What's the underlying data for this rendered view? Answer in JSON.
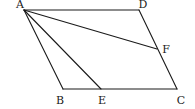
{
  "figure": {
    "type": "parallelogram-geometry",
    "points": {
      "A": {
        "label": "A",
        "x": 24,
        "y": 10,
        "lx": 20,
        "ly": 8
      },
      "D": {
        "label": "D",
        "x": 139,
        "y": 10,
        "lx": 143,
        "ly": 8
      },
      "F": {
        "label": "F",
        "x": 157,
        "y": 49,
        "lx": 166,
        "ly": 53
      },
      "C": {
        "label": "C",
        "x": 177,
        "y": 89,
        "lx": 181,
        "ly": 104
      },
      "B": {
        "label": "B",
        "x": 63,
        "y": 89,
        "lx": 60,
        "ly": 104
      },
      "E": {
        "label": "E",
        "x": 101,
        "y": 89,
        "lx": 102,
        "ly": 104
      }
    },
    "segments": [
      [
        "A",
        "D"
      ],
      [
        "D",
        "C"
      ],
      [
        "C",
        "B"
      ],
      [
        "B",
        "A"
      ],
      [
        "A",
        "E"
      ],
      [
        "A",
        "F"
      ]
    ]
  }
}
